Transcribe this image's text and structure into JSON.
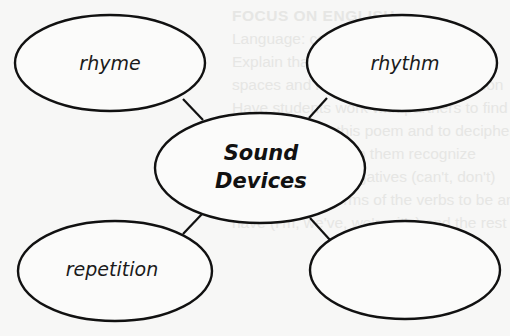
{
  "diagram": {
    "type": "concept-web",
    "center": {
      "label_line1": "Sound",
      "label_line2": "Devices"
    },
    "nodes": [
      {
        "id": "top-left",
        "label": "rhyme"
      },
      {
        "id": "top-right",
        "label": "rhythm"
      },
      {
        "id": "bottom-left",
        "label": "repetition"
      },
      {
        "id": "bottom-right",
        "label": ""
      }
    ],
    "stroke_color": "#111111",
    "background_color": "#f7f7f6"
  },
  "background_text": {
    "lines": [
      "FOCUS ON ENGLISH",
      "Language: contractions (point out)",
      "Explain that an apostrophe is placed",
      "spaces and letters to form a contraction",
      "Have students work with partners to find",
      "contractions in this poem and to decipher",
      "the meanings. Help them recognize",
      "contractions as negatives (can't, don't)",
      "the tense and forms of the verbs to be and",
      "have (I'm, we've, we're, it's) and the rest"
    ]
  }
}
